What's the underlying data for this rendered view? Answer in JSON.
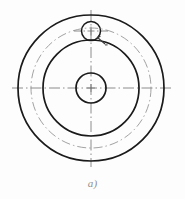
{
  "figure": {
    "caption": "a)",
    "kind": "engineering-drawing",
    "view": "axial-end-view",
    "background_color": "#fdfdfd",
    "line_color": "#1a1a1a",
    "centerline_color": "#6e6e6e",
    "hidden_line_color": "#8a8a8a",
    "caption_color": "#8f8f8f"
  },
  "geometry": {
    "center": {
      "x": 91,
      "y": 88
    },
    "circles": [
      {
        "name": "outer-rim-circle",
        "label": "Outer rim diameter",
        "cx": 91,
        "cy": 88,
        "r": 73,
        "style": "solid",
        "stroke_width": 1.7,
        "color": "#1a1a1a"
      },
      {
        "name": "bolt-circle",
        "label": "Bolt circle (pitch circle)",
        "cx": 91,
        "cy": 88,
        "r": 60,
        "style": "dash-dot",
        "stroke_width": 0.8,
        "color": "#8a8a8a"
      },
      {
        "name": "hub-circle",
        "label": "Hub outer diameter",
        "cx": 91,
        "cy": 88,
        "r": 48,
        "style": "solid",
        "stroke_width": 1.7,
        "color": "#1a1a1a"
      },
      {
        "name": "bore-circle",
        "label": "Central bore",
        "cx": 91,
        "cy": 88,
        "r": 15,
        "style": "solid",
        "stroke_width": 1.7,
        "color": "#1a1a1a"
      },
      {
        "name": "bolt-hole-circle",
        "label": "Bolt hole",
        "cx": 91,
        "cy": 31,
        "r": 9.5,
        "style": "solid",
        "stroke_width": 1.5,
        "color": "#1a1a1a"
      }
    ],
    "centerlines": [
      {
        "name": "horizontal-centerline",
        "x1": 12,
        "y1": 88,
        "x2": 173,
        "y2": 88,
        "style": "dash-dot",
        "color": "#6e6e6e"
      },
      {
        "name": "vertical-centerline",
        "x1": 91,
        "y1": 10,
        "x2": 91,
        "y2": 167,
        "style": "dash-dot",
        "color": "#6e6e6e"
      },
      {
        "name": "bolt-hole-horizontal-centerline",
        "x1": 74,
        "y1": 31,
        "x2": 108,
        "y2": 31,
        "style": "dash-dot",
        "color": "#6e6e6e"
      }
    ],
    "leader": {
      "name": "bolt-hole-leader",
      "label": "Leader with arrowhead at bolt hole",
      "from": {
        "x": 105,
        "y": 44
      },
      "to": {
        "x": 97,
        "y": 37
      },
      "color": "#3a3a3a"
    }
  }
}
